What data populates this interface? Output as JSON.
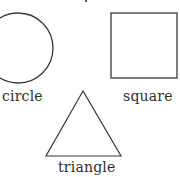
{
  "diagram": {
    "shapes": [
      {
        "id": "circle",
        "label": "circle"
      },
      {
        "id": "square",
        "label": "square"
      },
      {
        "id": "triangle",
        "label": "triangle"
      }
    ],
    "stroke_color": "#3a3a3a",
    "background_color": "#ffffff"
  }
}
